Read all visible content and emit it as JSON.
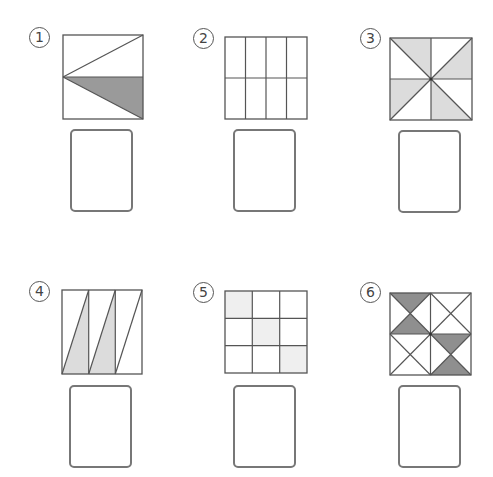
{
  "worksheet": {
    "problems": [
      {
        "label": "①",
        "number": "1",
        "description": "Square split by horizontal midline; triangles from left-midpoint to top-right and bottom-right corners; lower triangle shaded",
        "shade_color": "#9a9a9a"
      },
      {
        "label": "②",
        "number": "2",
        "description": "Square divided into 4 columns and 2 rows (8 equal rectangles), none shaded"
      },
      {
        "label": "③",
        "number": "3",
        "description": "Square with midlines and both diagonals (8 triangles), 4 triangles shaded in pinwheel pattern",
        "shade_color": "#dcdcdc"
      },
      {
        "label": "④",
        "number": "4",
        "description": "Square divided into 3 vertical strips each with a diagonal; lower-right triangles of first two strips shaded",
        "shade_color": "#dcdcdc"
      },
      {
        "label": "⑤",
        "number": "5",
        "description": "3x3 grid with the three diagonal cells lightly shaded",
        "shade_color": "#efefef"
      },
      {
        "label": "⑥",
        "number": "6",
        "description": "Square divided into 4 quadrants each crossed by both diagonals; top and bottom triangles of top-left and bottom-right quadrants shaded",
        "shade_color": "#8f8f8f"
      }
    ],
    "answer_box_value": ""
  },
  "colors": {
    "line": "#555555",
    "answer_border": "#777777"
  }
}
